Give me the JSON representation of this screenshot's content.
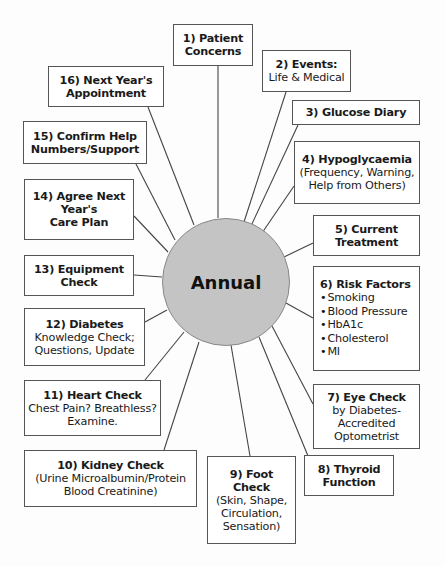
{
  "center": {
    "label": "Annual"
  },
  "nodes": [
    {
      "id": 1,
      "title": "1) Patient Concerns",
      "title_lines": [
        "1) Patient",
        "Concerns"
      ],
      "detail_lines": []
    },
    {
      "id": 2,
      "title_lines": [
        "2) Events:"
      ],
      "detail_lines": [
        "Life & Medical"
      ]
    },
    {
      "id": 3,
      "title_lines": [
        "3) Glucose Diary"
      ],
      "detail_lines": []
    },
    {
      "id": 4,
      "title_lines": [
        "4) Hypoglycaemia"
      ],
      "detail_lines": [
        "(Frequency, Warning,",
        "Help from Others)"
      ]
    },
    {
      "id": 5,
      "title_lines": [
        "5) Current",
        "Treatment"
      ],
      "detail_lines": []
    },
    {
      "id": 6,
      "title_lines": [
        "6) Risk Factors"
      ],
      "bullets": [
        "Smoking",
        "Blood Pressure",
        "HbA1c",
        "Cholesterol",
        "MI"
      ]
    },
    {
      "id": 7,
      "title_lines": [
        "7) Eye Check"
      ],
      "detail_lines": [
        "by Diabetes-",
        "Accredited",
        "Optometrist"
      ]
    },
    {
      "id": 8,
      "title_lines": [
        "8) Thyroid",
        "Function"
      ],
      "detail_lines": []
    },
    {
      "id": 9,
      "title_lines": [
        "9) Foot",
        "Check"
      ],
      "detail_lines": [
        "(Skin, Shape,",
        "Circulation,",
        "Sensation)"
      ]
    },
    {
      "id": 10,
      "title_lines": [
        "10) Kidney Check"
      ],
      "detail_lines": [
        "(Urine Microalbumin/Protein",
        "Blood Creatinine)"
      ]
    },
    {
      "id": 11,
      "title_lines": [
        "11) Heart Check"
      ],
      "detail_lines": [
        "Chest Pain? Breathless?",
        "Examine."
      ]
    },
    {
      "id": 12,
      "title_lines": [
        "12) Diabetes"
      ],
      "detail_lines": [
        "Knowledge Check;",
        "Questions, Update"
      ]
    },
    {
      "id": 13,
      "title_lines": [
        "13) Equipment",
        "Check"
      ],
      "detail_lines": []
    },
    {
      "id": 14,
      "title_lines": [
        "14) Agree Next",
        "Year's",
        "Care Plan"
      ],
      "detail_lines": []
    },
    {
      "id": 15,
      "title_lines": [
        "15) Confirm Help",
        "Numbers/Support"
      ],
      "detail_lines": []
    },
    {
      "id": 16,
      "title_lines": [
        "16) Next Year's",
        "Appointment"
      ],
      "detail_lines": []
    }
  ],
  "colors": {
    "circle_fill": "#c4c4c4",
    "line": "#444444",
    "box_border": "#555555"
  }
}
